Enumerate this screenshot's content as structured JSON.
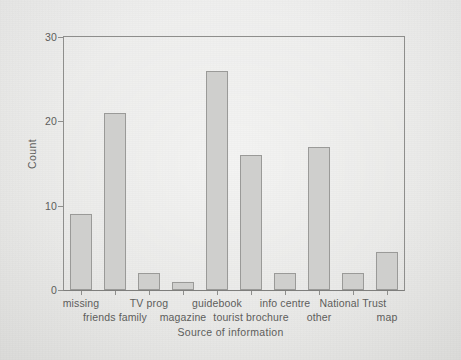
{
  "figure": {
    "background_color": "#e9e9e7",
    "axis_color": "#8e8e8c",
    "bar_fill_color": "#cfcfcd",
    "bar_edge_color": "#9a9a98",
    "text_color": "#5d5d5b"
  },
  "chart_data": {
    "type": "bar",
    "title": "",
    "xlabel": "Source of information",
    "ylabel": "Count",
    "categories": [
      "missing",
      "friends family",
      "TV prog",
      "magazine",
      "guidebook",
      "tourist brochure",
      "info centre",
      "other",
      "National Trust",
      "map"
    ],
    "values": [
      9,
      21,
      2,
      1,
      26,
      16,
      2,
      17,
      2,
      4.5
    ],
    "ylim": [
      0,
      30
    ],
    "yticks": [
      0,
      10,
      20,
      30
    ],
    "ytick_labels": [
      "0",
      "10",
      "20",
      "30"
    ],
    "grid": false,
    "legend": null,
    "label_rows": [
      0,
      1,
      0,
      1,
      0,
      1,
      0,
      1,
      0,
      1
    ]
  }
}
